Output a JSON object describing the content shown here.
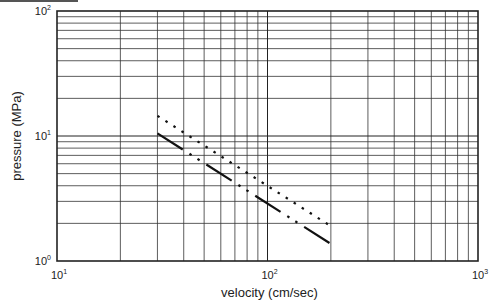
{
  "chart_data": {
    "type": "line",
    "title": "",
    "xlabel": "velocity (cm/sec)",
    "ylabel": "pressure (MPa)",
    "xscale": "log",
    "yscale": "log",
    "xlim": [
      10,
      1000
    ],
    "ylim": [
      1,
      100
    ],
    "x_tick_labels": [
      {
        "base": "10",
        "exp": "1"
      },
      {
        "base": "10",
        "exp": "2"
      },
      {
        "base": "10",
        "exp": "3"
      }
    ],
    "y_tick_labels": [
      {
        "base": "10",
        "exp": "0"
      },
      {
        "base": "10",
        "exp": "1"
      },
      {
        "base": "10",
        "exp": "2"
      }
    ],
    "grid": true,
    "legend": null,
    "series": [
      {
        "name": "upper (dotted)",
        "style": "dotted",
        "x": [
          30,
          200
        ],
        "y": [
          14.5,
          1.9
        ]
      },
      {
        "name": "lower (dash-dot-dot)",
        "style": "dash-dot-dot",
        "x": [
          30,
          200
        ],
        "y": [
          10.5,
          1.37
        ]
      }
    ]
  },
  "plot": {
    "left": 57,
    "right": 478,
    "top": 11,
    "bottom": 261
  }
}
